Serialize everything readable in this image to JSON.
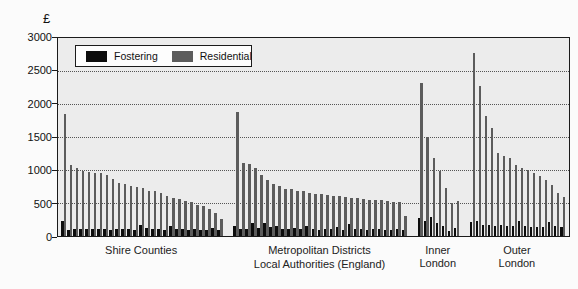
{
  "y_axis": {
    "currency_symbol": "£",
    "ticks": [
      3000,
      2500,
      2000,
      1500,
      1000,
      500,
      0
    ],
    "max": 3000
  },
  "legend": {
    "items": [
      {
        "name": "fostering",
        "label": "Fostering",
        "color": "#0d0d0d"
      },
      {
        "name": "residential",
        "label": "Residential",
        "color": "#5c5c5c"
      }
    ]
  },
  "axis_title": "Local Authorities (England)",
  "chart_data": {
    "type": "bar",
    "title": "",
    "xlabel": "Local Authorities (England)",
    "ylabel": "£",
    "ylim": [
      0,
      3000
    ],
    "gridlines": [
      2500,
      2000,
      1500,
      1000,
      500
    ],
    "grid": "dotted-horizontal",
    "legend_position": "top-left-inside",
    "series_names": [
      "Fostering",
      "Residential"
    ],
    "groups": [
      {
        "label": [
          "Shire Counties"
        ],
        "fostering": [
          230,
          95,
          110,
          100,
          105,
          110,
          100,
          105,
          95,
          100,
          110,
          100,
          95,
          160,
          120,
          100,
          110,
          95,
          150,
          100,
          110,
          95,
          100,
          90,
          85,
          125,
          95
        ],
        "residential": [
          1845,
          1080,
          1030,
          985,
          975,
          960,
          950,
          930,
          870,
          805,
          795,
          755,
          740,
          720,
          685,
          675,
          655,
          605,
          570,
          560,
          530,
          515,
          465,
          455,
          405,
          355,
          255
        ]
      },
      {
        "label": [
          "Metropolitan Districts"
        ],
        "fostering": [
          150,
          100,
          105,
          200,
          120,
          195,
          130,
          155,
          100,
          110,
          120,
          105,
          150,
          100,
          95,
          110,
          100,
          140,
          95,
          185,
          105,
          100,
          95,
          110,
          100,
          90,
          95,
          100,
          90
        ],
        "residential": [
          1880,
          1100,
          1095,
          1030,
          930,
          855,
          790,
          755,
          715,
          710,
          680,
          675,
          650,
          640,
          630,
          620,
          610,
          600,
          590,
          580,
          570,
          560,
          550,
          545,
          540,
          530,
          520,
          510,
          305
        ]
      },
      {
        "label": [
          "Inner",
          "London"
        ],
        "fostering": [
          280,
          230,
          290,
          190,
          150,
          80,
          125
        ],
        "residential": [
          2320,
          1505,
          1180,
          980,
          730,
          500,
          535
        ]
      },
      {
        "label": [
          "Outer",
          "London"
        ],
        "fostering": [
          205,
          230,
          170,
          160,
          150,
          160,
          150,
          145,
          220,
          150,
          140,
          135,
          130,
          210,
          150,
          140
        ],
        "residential": [
          2780,
          2280,
          1815,
          1630,
          1255,
          1205,
          1180,
          1080,
          1030,
          1005,
          955,
          905,
          855,
          780,
          655,
          590
        ]
      }
    ]
  }
}
